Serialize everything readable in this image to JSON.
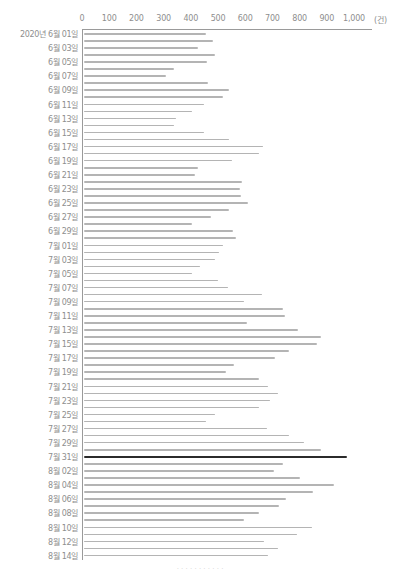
{
  "chart_data": {
    "type": "bar",
    "orientation": "horizontal",
    "title": "",
    "xlabel": "(건)",
    "ylabel": "",
    "xlim": [
      0,
      1000
    ],
    "x_ticks": [
      "0",
      "100",
      "200",
      "300",
      "400",
      "500",
      "600",
      "700",
      "800",
      "900",
      "1,000"
    ],
    "x_unit": "(건)",
    "grid": false,
    "legend": null,
    "highlight": {
      "category": "7월 31일",
      "color": "#2b2b2b"
    },
    "bar_color": "#b4b4b4",
    "y_tick_labels": [
      "2020년 6월 01일",
      "6월 03일",
      "6월 05일",
      "6월 07일",
      "6월 09일",
      "6월 11일",
      "6월 13일",
      "6월 15일",
      "6월 17일",
      "6월 19일",
      "6월 21일",
      "6월 23일",
      "6월 25일",
      "6월 27일",
      "6월 29일",
      "7월 01일",
      "7월 03일",
      "7월 05일",
      "7월 07일",
      "7월 09일",
      "7월 11일",
      "7월 13일",
      "7월 15일",
      "7월 17일",
      "7월 19일",
      "7월 21일",
      "7월 23일",
      "7월 25일",
      "7월 27일",
      "7월 29일",
      "7월 31일",
      "8월 02일",
      "8월 04일",
      "8월 06일",
      "8월 08일",
      "8월 10일",
      "8월 12일",
      "8월 14일"
    ],
    "categories": [
      "6/01",
      "6/02",
      "6/03",
      "6/04",
      "6/05",
      "6/06",
      "6/07",
      "6/08",
      "6/09",
      "6/10",
      "6/11",
      "6/12",
      "6/13",
      "6/14",
      "6/15",
      "6/16",
      "6/17",
      "6/18",
      "6/19",
      "6/20",
      "6/21",
      "6/22",
      "6/23",
      "6/24",
      "6/25",
      "6/26",
      "6/27",
      "6/28",
      "6/29",
      "6/30",
      "7/01",
      "7/02",
      "7/03",
      "7/04",
      "7/05",
      "7/06",
      "7/07",
      "7/08",
      "7/09",
      "7/10",
      "7/11",
      "7/12",
      "7/13",
      "7/14",
      "7/15",
      "7/16",
      "7/17",
      "7/18",
      "7/19",
      "7/20",
      "7/21",
      "7/22",
      "7/23",
      "7/24",
      "7/25",
      "7/26",
      "7/27",
      "7/28",
      "7/29",
      "7/30",
      "7/31",
      "8/01",
      "8/02",
      "8/03",
      "8/04",
      "8/05",
      "8/06",
      "8/07",
      "8/08",
      "8/09",
      "8/10",
      "8/11",
      "8/12",
      "8/13",
      "8/14"
    ],
    "values": [
      455,
      480,
      425,
      490,
      460,
      340,
      310,
      465,
      540,
      520,
      450,
      405,
      345,
      340,
      450,
      540,
      665,
      650,
      550,
      425,
      415,
      590,
      580,
      585,
      610,
      540,
      475,
      405,
      555,
      565,
      520,
      505,
      490,
      435,
      405,
      500,
      535,
      660,
      595,
      740,
      745,
      605,
      795,
      880,
      865,
      760,
      710,
      560,
      530,
      650,
      685,
      720,
      690,
      650,
      490,
      455,
      680,
      760,
      815,
      880,
      975,
      740,
      705,
      800,
      925,
      850,
      750,
      725,
      650,
      595,
      845,
      790,
      670,
      720,
      685
    ]
  },
  "caption": "· · · · · · · · · · ·"
}
